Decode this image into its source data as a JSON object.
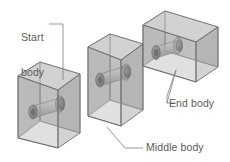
{
  "figure": {
    "type": "technical-illustration",
    "background_color": "#ffffff"
  },
  "labels": {
    "start": "Start\nbody",
    "start_line1": "Start",
    "start_line2": "body",
    "middle": "Middle body",
    "end": "End body"
  },
  "colors": {
    "outline": "#6e6e6e",
    "box_front": "#b9b9b9",
    "box_top": "#d2d2d2",
    "box_side": "#a3a3a3",
    "box_back": "#cfcfcf",
    "cylinder_body": "#b0b0b0",
    "cylinder_cap_dark": "#5a5a5a",
    "cylinder_cap_mid": "#8d8d8d",
    "leader_line": "#8a8a8a",
    "text": "#5b5b5b"
  },
  "bodies": [
    {
      "name": "start-body",
      "label": "Start body",
      "order": 1,
      "position": "left",
      "shape": "rectangular-box",
      "contains": "cylinder"
    },
    {
      "name": "middle-body",
      "label": "Middle body",
      "order": 2,
      "position": "center",
      "shape": "rectangular-box",
      "contains": "cylinder"
    },
    {
      "name": "end-body",
      "label": "End body",
      "order": 3,
      "position": "right",
      "shape": "rectangular-box",
      "contains": "cylinder"
    }
  ],
  "leaders": [
    {
      "name": "start-leader",
      "from": "Start body label",
      "to": "left box top edge"
    },
    {
      "name": "middle-leader",
      "from": "Middle body label",
      "to": "center box bottom corner"
    },
    {
      "name": "end-leader",
      "from": "End body label",
      "to": "right box bottom edge"
    }
  ]
}
